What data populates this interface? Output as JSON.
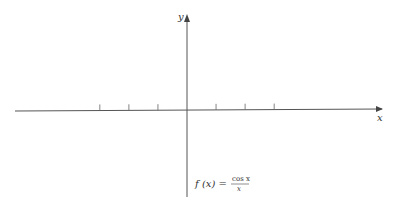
{
  "chart_data": {
    "type": "line",
    "title": "",
    "function_label": {
      "lhs": "f (x) =",
      "numerator": "cos x",
      "denominator": "x"
    },
    "xlabel": "x",
    "ylabel": "y",
    "xlim": [
      -7.4,
      7.8
    ],
    "ylim": [
      -3.2,
      3.2
    ],
    "x_ticks": [
      -4.712,
      -3.1416,
      -1.5708,
      1.5708,
      3.1416,
      4.712
    ],
    "tick_labels": [],
    "grid": false,
    "series": [
      {
        "name": "cos x / x",
        "expression": "cos(x)/x",
        "domain_left": [
          -7.4,
          -0.22
        ],
        "domain_right": [
          0.3,
          7.8
        ]
      }
    ],
    "colors": {
      "curve": "#333333",
      "axis": "#555555"
    }
  }
}
